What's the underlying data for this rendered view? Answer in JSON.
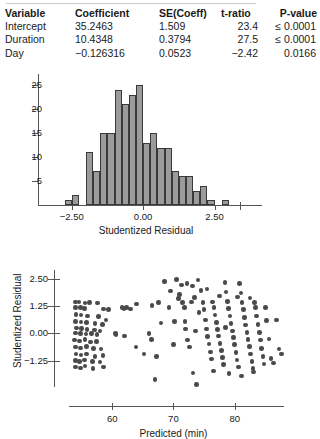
{
  "regression_table": {
    "columns": [
      "Variable",
      "Coefficient",
      "SE(Coeff)",
      "t-ratio",
      "P-value"
    ],
    "rows": [
      {
        "variable": "Intercept",
        "coefficient": "35.2463",
        "se": "1.509",
        "t": "23.4",
        "p": "≤ 0.0001"
      },
      {
        "variable": "Duration",
        "coefficient": "10.4348",
        "se": "0.3794",
        "t": "27.5",
        "p": "≤ 0.0001"
      },
      {
        "variable": "Day",
        "coefficient": "−0.126316",
        "se": "0.0523",
        "t": "−2.42",
        "p": "0.0166"
      }
    ]
  },
  "chart_data": [
    {
      "type": "bar",
      "name": "studentized-residual-histogram",
      "title": "",
      "xlabel": "Studentized Residual",
      "ylabel": "",
      "xlim": [
        -3.4,
        3.6
      ],
      "ylim": [
        0,
        26.5
      ],
      "xticks": [
        -2.5,
        0.0,
        2.5
      ],
      "xticklabels": [
        "−2.50",
        "0.00",
        "2.50"
      ],
      "yticks": [
        5,
        10,
        15,
        20,
        25
      ],
      "yticklabels": [
        "5",
        "10",
        "15",
        "20",
        "25"
      ],
      "grid": false,
      "legend": null,
      "bin_width": 0.25,
      "bin_starts": [
        -2.75,
        -2.5,
        -2.0,
        -1.75,
        -1.5,
        -1.25,
        -1.0,
        -0.75,
        -0.5,
        -0.25,
        0.0,
        0.25,
        0.5,
        0.75,
        1.0,
        1.25,
        1.5,
        1.75,
        2.0,
        2.25,
        2.75
      ],
      "values": [
        1,
        2,
        11,
        7,
        15,
        15,
        24,
        21,
        23,
        25,
        13,
        15,
        12,
        12,
        7,
        6,
        6,
        3,
        4,
        1,
        1
      ]
    },
    {
      "type": "scatter",
      "name": "residual-vs-predicted-scatter",
      "title": "",
      "xlabel": "Predicted (min)",
      "ylabel": "Studentized Residual",
      "xlim": [
        51,
        90
      ],
      "ylim": [
        -2.6,
        3.1
      ],
      "xticks": [
        60,
        70,
        80
      ],
      "xticklabels": [
        "60",
        "70",
        "80"
      ],
      "yticks": [
        -1.25,
        0.0,
        1.25,
        2.5
      ],
      "yticklabels": [
        "−1.25",
        "0.00",
        "1.25",
        "2.50"
      ],
      "grid": false,
      "legend": null,
      "points": [
        [
          54.0,
          1.45
        ],
        [
          54.6,
          1.45
        ],
        [
          55.6,
          1.4
        ],
        [
          56.3,
          1.42
        ],
        [
          57.6,
          1.4
        ],
        [
          54.0,
          1.18
        ],
        [
          54.8,
          1.2
        ],
        [
          55.5,
          1.15
        ],
        [
          58.6,
          1.12
        ],
        [
          59.4,
          1.1
        ],
        [
          61.6,
          1.2
        ],
        [
          62.3,
          1.18
        ],
        [
          64.0,
          1.35
        ],
        [
          66.5,
          1.28
        ],
        [
          67.6,
          1.42
        ],
        [
          54.1,
          0.88
        ],
        [
          54.9,
          0.85
        ],
        [
          56.0,
          0.8
        ],
        [
          57.8,
          0.78
        ],
        [
          59.0,
          0.62
        ],
        [
          54.0,
          0.55
        ],
        [
          54.9,
          0.52
        ],
        [
          55.8,
          0.5
        ],
        [
          57.2,
          0.45
        ],
        [
          58.4,
          0.4
        ],
        [
          54.2,
          0.25
        ],
        [
          55.0,
          0.22
        ],
        [
          55.9,
          0.18
        ],
        [
          57.1,
          0.15
        ],
        [
          58.0,
          0.12
        ],
        [
          54.0,
          0.02
        ],
        [
          54.8,
          0.0
        ],
        [
          55.7,
          -0.02
        ],
        [
          56.6,
          0.0
        ],
        [
          57.5,
          -0.05
        ],
        [
          53.9,
          -0.3
        ],
        [
          54.7,
          -0.34
        ],
        [
          55.6,
          -0.28
        ],
        [
          56.5,
          -0.4
        ],
        [
          57.4,
          -0.38
        ],
        [
          54.0,
          -0.62
        ],
        [
          54.8,
          -0.66
        ],
        [
          55.8,
          -0.6
        ],
        [
          57.0,
          -0.7
        ],
        [
          58.2,
          -0.72
        ],
        [
          54.1,
          -0.95
        ],
        [
          54.9,
          -1.0
        ],
        [
          55.8,
          -0.95
        ],
        [
          57.2,
          -1.05
        ],
        [
          58.5,
          -1.02
        ],
        [
          54.0,
          -1.25
        ],
        [
          54.7,
          -1.28
        ],
        [
          55.5,
          -1.22
        ],
        [
          56.8,
          -1.3
        ],
        [
          58.0,
          -1.32
        ],
        [
          54.0,
          -1.55
        ],
        [
          54.8,
          -1.58
        ],
        [
          55.6,
          -1.5
        ],
        [
          56.9,
          -1.6
        ],
        [
          58.6,
          -1.55
        ],
        [
          60.5,
          0.0
        ],
        [
          60.6,
          -0.05
        ],
        [
          62.0,
          -0.12
        ],
        [
          61.9,
          1.15
        ],
        [
          63.0,
          1.12
        ],
        [
          63.9,
          -0.62
        ],
        [
          65.2,
          -0.95
        ],
        [
          66.0,
          0.0
        ],
        [
          66.4,
          -0.28
        ],
        [
          67.2,
          -1.05
        ],
        [
          67.0,
          -2.12
        ],
        [
          69.3,
          1.18
        ],
        [
          70.2,
          0.55
        ],
        [
          70.5,
          2.48
        ],
        [
          71.0,
          1.78
        ],
        [
          71.3,
          2.22
        ],
        [
          71.5,
          1.42
        ],
        [
          71.8,
          1.18
        ],
        [
          71.9,
          0.55
        ],
        [
          72.0,
          0.2
        ],
        [
          72.3,
          -0.3
        ],
        [
          72.6,
          -0.62
        ],
        [
          72.9,
          1.45
        ],
        [
          73.1,
          2.18
        ],
        [
          73.4,
          1.65
        ],
        [
          73.2,
          -1.82
        ],
        [
          68.5,
          2.4
        ],
        [
          69.5,
          1.95
        ],
        [
          74.0,
          2.45
        ],
        [
          74.5,
          1.98
        ],
        [
          74.8,
          1.42
        ],
        [
          75.0,
          1.1
        ],
        [
          75.2,
          0.62
        ],
        [
          75.4,
          0.2
        ],
        [
          75.6,
          -0.15
        ],
        [
          75.8,
          -0.48
        ],
        [
          76.0,
          -0.85
        ],
        [
          76.2,
          -1.18
        ],
        [
          76.4,
          1.45
        ],
        [
          76.6,
          1.2
        ],
        [
          76.8,
          0.85
        ],
        [
          77.0,
          0.5
        ],
        [
          77.2,
          0.18
        ],
        [
          77.4,
          -0.12
        ],
        [
          77.6,
          -0.45
        ],
        [
          77.8,
          -0.78
        ],
        [
          78.0,
          -1.1
        ],
        [
          78.2,
          -1.42
        ],
        [
          78.4,
          2.35
        ],
        [
          78.6,
          1.9
        ],
        [
          78.8,
          1.48
        ],
        [
          79.0,
          1.15
        ],
        [
          79.2,
          0.8
        ],
        [
          79.4,
          0.45
        ],
        [
          79.6,
          0.12
        ],
        [
          79.8,
          -0.2
        ],
        [
          80.0,
          -0.52
        ],
        [
          80.2,
          -0.88
        ],
        [
          80.4,
          -1.22
        ],
        [
          80.6,
          -1.55
        ],
        [
          80.8,
          2.3
        ],
        [
          81.0,
          1.85
        ],
        [
          81.2,
          1.42
        ],
        [
          81.4,
          1.1
        ],
        [
          81.6,
          0.72
        ],
        [
          81.8,
          0.38
        ],
        [
          82.0,
          0.05
        ],
        [
          82.2,
          -0.28
        ],
        [
          82.4,
          -0.6
        ],
        [
          82.6,
          -0.95
        ],
        [
          82.8,
          -1.28
        ],
        [
          83.0,
          -1.62
        ],
        [
          83.2,
          1.42
        ],
        [
          83.4,
          1.18
        ],
        [
          83.6,
          0.8
        ],
        [
          83.8,
          0.42
        ],
        [
          84.0,
          0.05
        ],
        [
          84.2,
          -0.3
        ],
        [
          84.4,
          -0.68
        ],
        [
          84.6,
          -1.05
        ],
        [
          84.8,
          -1.4
        ],
        [
          85.2,
          0.6
        ],
        [
          85.6,
          -0.25
        ],
        [
          85.9,
          -1.15
        ],
        [
          86.3,
          -1.35
        ],
        [
          86.8,
          0.62
        ],
        [
          87.2,
          -0.72
        ],
        [
          87.6,
          -0.95
        ],
        [
          73.8,
          -2.35
        ],
        [
          70.8,
          1.6
        ],
        [
          74.2,
          0.95
        ],
        [
          76.5,
          -1.72
        ],
        [
          79.1,
          -1.85
        ],
        [
          81.1,
          -1.95
        ],
        [
          83.1,
          -1.78
        ],
        [
          72.2,
          2.3
        ],
        [
          75.5,
          2.05
        ],
        [
          77.5,
          1.72
        ],
        [
          80.5,
          1.68
        ],
        [
          82.5,
          1.62
        ],
        [
          68.0,
          0.48
        ],
        [
          70.0,
          -0.52
        ],
        [
          73.6,
          0.12
        ],
        [
          78.5,
          0.28
        ],
        [
          85.0,
          1.18
        ]
      ]
    }
  ]
}
